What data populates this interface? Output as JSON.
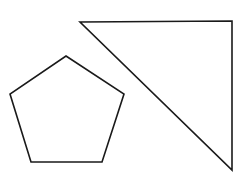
{
  "figure": {
    "width": 249,
    "height": 185,
    "background": "#ffffff",
    "stroke": "#1a1a1a",
    "stroke_width": 1.6
  },
  "shapes": [
    {
      "name": "pentagon",
      "type": "polygon",
      "points": "66,56 124,94 102,162 31,162 10,94"
    },
    {
      "name": "right-triangle",
      "type": "polygon",
      "points": "80,22 232,21 232,170"
    }
  ]
}
